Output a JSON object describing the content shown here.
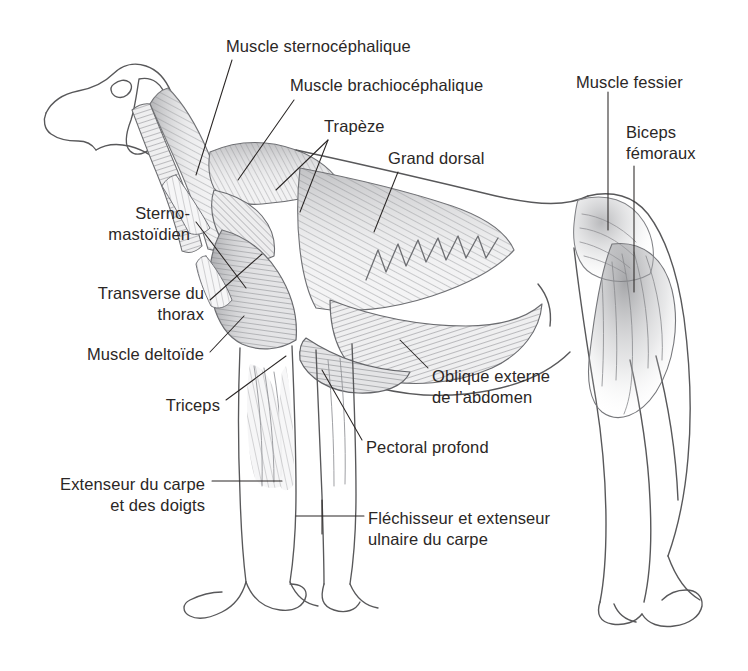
{
  "figure": {
    "language": "fr",
    "background_color": "#ffffff",
    "ink_color": "#4a4a4a",
    "text_color": "#2b2726",
    "muscle_fill_light": "#e9e9ea",
    "muscle_fill_mid": "#c3c4c6",
    "muscle_fill_dark": "#9a9b9e"
  },
  "labels": [
    {
      "id": "sternocephalique",
      "text": "Muscle sternocéphalique",
      "align": "left",
      "x": 226,
      "y": 36
    },
    {
      "id": "brachiocephalique",
      "text": "Muscle brachiocéphalique",
      "align": "left",
      "x": 290,
      "y": 75
    },
    {
      "id": "trapeze",
      "text": "Trapèze",
      "align": "left",
      "x": 324,
      "y": 116
    },
    {
      "id": "grand-dorsal",
      "text": "Grand dorsal",
      "align": "left",
      "x": 388,
      "y": 148
    },
    {
      "id": "muscle-fessier",
      "text": "Muscle fessier",
      "align": "left",
      "x": 576,
      "y": 72
    },
    {
      "id": "biceps-femoraux",
      "text": "Biceps\nfémoraux",
      "align": "left",
      "x": 626,
      "y": 122
    },
    {
      "id": "sterno-mastoidien",
      "text": "Sterno-\nmastoïdien",
      "align": "right",
      "x": 190,
      "y": 203
    },
    {
      "id": "transverse-thorax",
      "text": "Transverse du\nthorax",
      "align": "right",
      "x": 204,
      "y": 283
    },
    {
      "id": "muscle-deltoide",
      "text": "Muscle deltoïde",
      "align": "right",
      "x": 204,
      "y": 344
    },
    {
      "id": "triceps",
      "text": "Triceps",
      "align": "right",
      "x": 220,
      "y": 395
    },
    {
      "id": "oblique-externe",
      "text": "Oblique externe\nde l’abdomen",
      "align": "left",
      "x": 432,
      "y": 366
    },
    {
      "id": "pectoral-profond",
      "text": "Pectoral profond",
      "align": "left",
      "x": 366,
      "y": 437
    },
    {
      "id": "extenseur-carpe",
      "text": "Extenseur du carpe\net des doigts",
      "align": "right",
      "x": 205,
      "y": 474
    },
    {
      "id": "flechisseur-ulnaire",
      "text": "Fléchisseur et extenseur\nulnaire du carpe",
      "align": "left",
      "x": 368,
      "y": 508
    }
  ]
}
